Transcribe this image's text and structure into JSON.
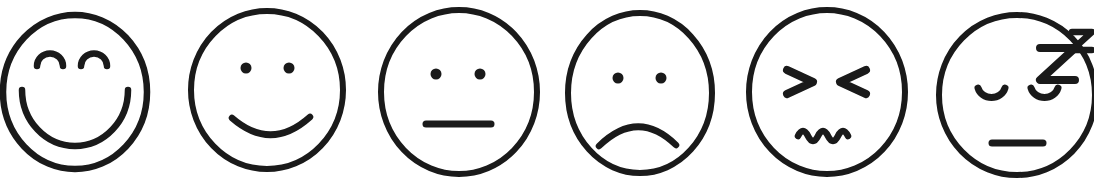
{
  "canvas": {
    "width": 1094,
    "height": 178,
    "background_color": "#ffffff",
    "stroke_color": "#1a1a1a",
    "title": "Row of six hand-drawn emoticon faces"
  },
  "style": {
    "stroke_width_outline": 6,
    "stroke_width_feature": 6.5,
    "line_cap": "round"
  },
  "faces": [
    {
      "id": "face-1",
      "name": "very-happy-face",
      "label": "Very happy",
      "mood": "very happy",
      "order": 1,
      "head": {
        "cx": 75,
        "cy": 92,
        "rx": 73,
        "ry": 78
      },
      "eyes": {
        "type": "arc-up",
        "left": {
          "cx": 50,
          "cy": 64,
          "rx": 13,
          "ry": 12
        },
        "right": {
          "cx": 94,
          "cy": 64,
          "rx": 13,
          "ry": 12
        }
      },
      "mouth": {
        "type": "big-smile",
        "cx": 75,
        "cy": 90,
        "rx": 53,
        "ry": 56
      }
    },
    {
      "id": "face-2",
      "name": "happy-face",
      "label": "Happy",
      "mood": "happy",
      "order": 2,
      "head": {
        "cx": 267,
        "cy": 90,
        "rx": 77,
        "ry": 80
      },
      "eyes": {
        "type": "dot",
        "left": {
          "cx": 246,
          "cy": 68,
          "r": 5.5
        },
        "right": {
          "cx": 289,
          "cy": 68,
          "r": 5.5
        }
      },
      "mouth": {
        "type": "smile",
        "x1": 232,
        "y1": 118,
        "x2": 310,
        "y2": 118,
        "depth": 28
      }
    },
    {
      "id": "face-3",
      "name": "neutral-face",
      "label": "Neutral",
      "mood": "neutral",
      "order": 3,
      "head": {
        "cx": 459,
        "cy": 92,
        "rx": 79,
        "ry": 83
      },
      "eyes": {
        "type": "dot",
        "left": {
          "cx": 436,
          "cy": 74,
          "r": 5.5
        },
        "right": {
          "cx": 480,
          "cy": 74,
          "r": 5.5
        }
      },
      "mouth": {
        "type": "flat-line",
        "x1": 425,
        "x2": 491,
        "y": 124
      }
    },
    {
      "id": "face-4",
      "name": "sad-face",
      "label": "Sad",
      "mood": "sad",
      "order": 4,
      "head": {
        "cx": 640,
        "cy": 93,
        "rx": 73,
        "ry": 81
      },
      "eyes": {
        "type": "dot",
        "left": {
          "cx": 618,
          "cy": 78,
          "r": 5.5
        },
        "right": {
          "cx": 661,
          "cy": 78,
          "r": 5.5
        }
      },
      "mouth": {
        "type": "frown",
        "x1": 599,
        "y1": 145,
        "x2": 676,
        "y2": 145,
        "depth": 30
      }
    },
    {
      "id": "face-5",
      "name": "distressed-face",
      "label": "Distressed",
      "mood": "distressed",
      "order": 5,
      "head": {
        "cx": 827,
        "cy": 92,
        "rx": 79,
        "ry": 83
      },
      "eyes": {
        "type": "squint-x",
        "left_glyph": ">",
        "right_glyph": "<",
        "left": {
          "x": 786,
          "y": 68,
          "w": 28,
          "h": 27
        },
        "right": {
          "x": 839,
          "y": 68,
          "w": 28,
          "h": 27
        }
      },
      "mouth": {
        "type": "squiggle",
        "x1": 798,
        "x2": 853,
        "y": 136,
        "waves": 3,
        "amplitude": 8
      }
    },
    {
      "id": "face-6",
      "name": "sleepy-face",
      "label": "Sleepy",
      "mood": "sleepy / asleep",
      "order": 6,
      "head": {
        "cx": 1017,
        "cy": 95,
        "rx": 79,
        "ry": 81
      },
      "eyes": {
        "type": "arc-down",
        "left": {
          "cx": 991,
          "cy": 90,
          "rx": 14,
          "ry": 13
        },
        "right": {
          "cx": 1044,
          "cy": 90,
          "rx": 14,
          "ry": 13
        }
      },
      "mouth": {
        "type": "flat-line",
        "x1": 991,
        "x2": 1043,
        "y": 143
      },
      "sleep_marks": [
        {
          "glyph": "Z",
          "x": 1039,
          "y": 42,
          "w": 37,
          "h": 40,
          "size": "large"
        },
        {
          "glyph": "z",
          "x": 1071,
          "y": 28,
          "w": 22,
          "h": 25,
          "size": "small"
        }
      ]
    }
  ]
}
